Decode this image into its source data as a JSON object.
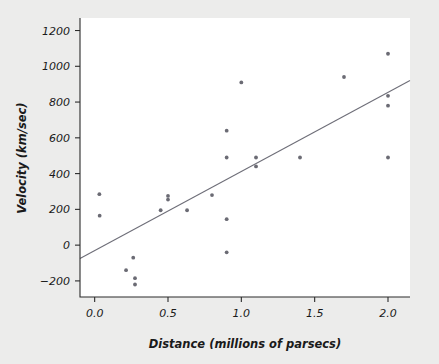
{
  "chart_data": {
    "type": "scatter",
    "title": "",
    "xlabel": "Distance (millions of parsecs)",
    "ylabel": "Velocity (km/sec)",
    "xlim": [
      -0.1,
      2.15
    ],
    "ylim": [
      -290,
      1270
    ],
    "xticks": [
      0.0,
      0.5,
      1.0,
      1.5,
      2.0
    ],
    "xticklabels": [
      "0.0",
      "0.5",
      "1.0",
      "1.5",
      "2.0"
    ],
    "yticks": [
      -200,
      0,
      200,
      400,
      600,
      800,
      1000,
      1200
    ],
    "yticklabels": [
      "−200",
      "0",
      "200",
      "400",
      "600",
      "800",
      "1000",
      "1200"
    ],
    "grid": false,
    "legend": null,
    "marker": "circle",
    "marker_color": "#6b6b74",
    "marker_size": 3,
    "x": [
      0.032,
      0.034,
      0.214,
      0.263,
      0.275,
      0.275,
      0.45,
      0.5,
      0.5,
      0.63,
      0.8,
      0.9,
      0.9,
      0.9,
      0.9,
      1.0,
      1.1,
      1.1,
      1.4,
      1.7,
      2.0,
      2.0,
      2.0,
      2.0
    ],
    "y": [
      285,
      165,
      -140,
      -70,
      -185,
      -220,
      195,
      275,
      255,
      195,
      280,
      640,
      490,
      145,
      -40,
      910,
      490,
      440,
      490,
      940,
      1070,
      835,
      780,
      490
    ],
    "fit_line": {
      "type": "line",
      "name": "least-squares fit",
      "color": "#6e6e78",
      "x_start": -0.1,
      "y_start": -75,
      "x_end": 2.15,
      "y_end": 920
    }
  },
  "figure": {
    "background_color": "#ececeb",
    "plot_background_color": "#ffffff",
    "axis_color": "#2b2b2b"
  }
}
